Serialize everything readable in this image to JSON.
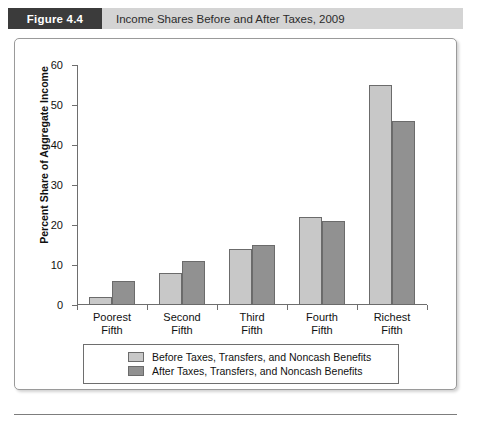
{
  "header": {
    "badge_label": "Figure 4.4",
    "caption": "Income Shares Before and After Taxes, 2009",
    "badge_bg": "#3b3b3b",
    "band_bg": "#d4d4d4"
  },
  "chart_data": {
    "type": "bar",
    "title": "Income Shares Before and After Taxes, 2009",
    "xlabel": "",
    "ylabel": "Percent Share of Aggregate Income",
    "ylim": [
      0,
      60
    ],
    "ytick_step": 10,
    "yticks": [
      "0",
      "10",
      "20",
      "30",
      "40",
      "50",
      "60"
    ],
    "grid": false,
    "legend_position": "below-axis",
    "categories": [
      "Poorest\nFifth",
      "Second\nFifth",
      "Third\nFifth",
      "Fourth\nFifth",
      "Richest\nFifth"
    ],
    "category_lines": [
      [
        "Poorest",
        "Fifth"
      ],
      [
        "Second",
        "Fifth"
      ],
      [
        "Third",
        "Fifth"
      ],
      [
        "Fourth",
        "Fifth"
      ],
      [
        "Richest",
        "Fifth"
      ]
    ],
    "series": [
      {
        "name": "Before Taxes, Transfers, and Noncash Benefits",
        "color": "#c8c8c8",
        "values": [
          2,
          8,
          14,
          22,
          55
        ]
      },
      {
        "name": "After Taxes, Transfers, and Noncash Benefits",
        "color": "#919191",
        "values": [
          6,
          11,
          15,
          21,
          46
        ]
      }
    ]
  },
  "legend": {
    "entries": [
      {
        "label": "Before Taxes, Transfers, and Noncash Benefits",
        "color": "#c8c8c8"
      },
      {
        "label": "After Taxes, Transfers, and Noncash Benefits",
        "color": "#919191"
      }
    ]
  }
}
